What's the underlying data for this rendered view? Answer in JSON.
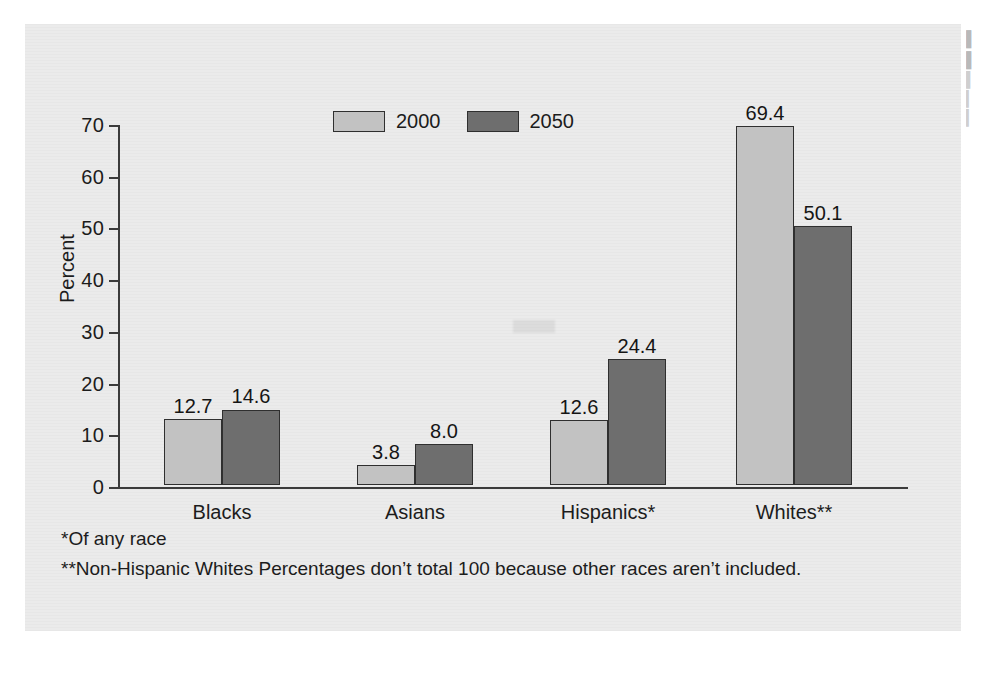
{
  "figure": {
    "background_color": "#ebebeb",
    "page_color": "#ffffff"
  },
  "axis": {
    "y_title": "Percent",
    "y_ticks": [
      "0",
      "10",
      "20",
      "30",
      "40",
      "50",
      "60",
      "70"
    ]
  },
  "legend": {
    "entries": [
      {
        "label": "2000",
        "color": "#c2c2c2"
      },
      {
        "label": "2050",
        "color": "#6e6e6e"
      }
    ]
  },
  "footnotes": [
    "*Of any race",
    "**Non-Hispanic Whites Percentages don’t total 100 because other races aren’t included."
  ],
  "margin_column": {
    "lines": [
      "▌",
      "▌",
      "▍",
      "▎",
      "▎"
    ]
  },
  "chart_data": {
    "type": "bar",
    "title": "",
    "subtitle": "",
    "xlabel": "",
    "ylabel": "Percent",
    "ylim": [
      0,
      70
    ],
    "ytick_step": 10,
    "grid": false,
    "legend_position": "top-center",
    "categories": [
      "Blacks",
      "Asians",
      "Hispanics*",
      "Whites**"
    ],
    "series": [
      {
        "name": "2000",
        "color": "#c2c2c2",
        "values": [
          12.7,
          3.8,
          12.6,
          69.4
        ]
      },
      {
        "name": "2050",
        "color": "#6e6e6e",
        "values": [
          14.6,
          8.0,
          24.4,
          50.1
        ]
      }
    ],
    "value_labels": [
      [
        "12.7",
        "3.8",
        "12.6",
        "69.4"
      ],
      [
        "14.6",
        "8.0",
        "24.4",
        "50.1"
      ]
    ],
    "notes": [
      "*Of any race",
      "**Non-Hispanic Whites Percentages don’t total 100 because other races aren’t included."
    ]
  }
}
